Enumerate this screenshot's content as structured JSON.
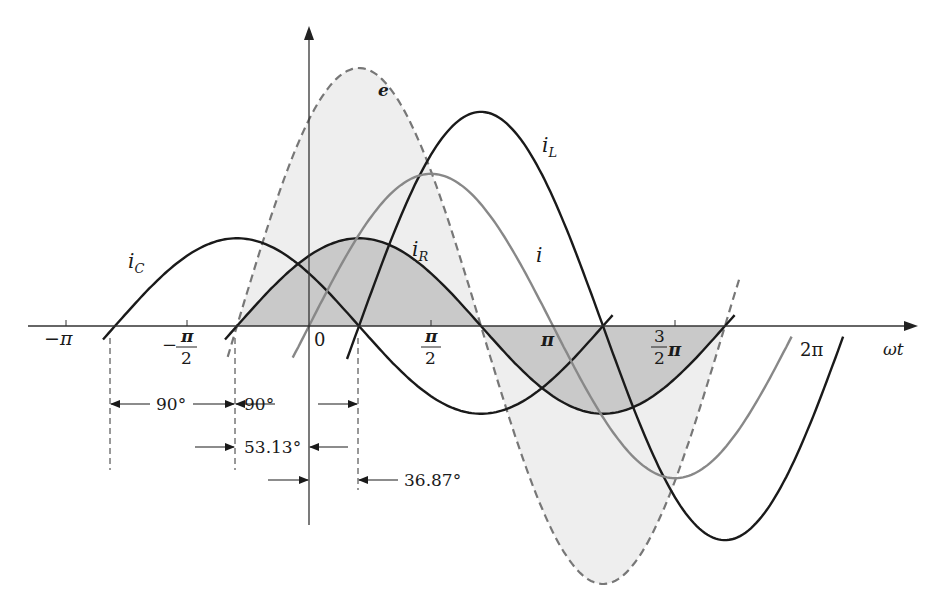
{
  "chart_data": {
    "type": "line",
    "title": "",
    "xlabel": "ωt",
    "ylabel": "",
    "x_ticks": [
      "−π",
      "−π/2",
      "0",
      "π/2",
      "π",
      "3/2 π",
      "2π"
    ],
    "x_units": "radians",
    "series": [
      {
        "name": "e",
        "style": "dashed",
        "color": "#777777",
        "amplitude": 1.0,
        "phase_deg": 53.13,
        "shaded": true
      },
      {
        "name": "i_R",
        "style": "solid",
        "color": "#1a1a1a",
        "amplitude": 0.34,
        "phase_deg": 53.13,
        "shaded": true
      },
      {
        "name": "i_C",
        "style": "solid",
        "color": "#1a1a1a",
        "amplitude": 0.34,
        "phase_deg": 143.13
      },
      {
        "name": "i_L",
        "style": "solid",
        "color": "#1a1a1a",
        "amplitude": 0.83,
        "phase_deg": -36.87
      },
      {
        "name": "i",
        "style": "solid",
        "color": "#888888",
        "amplitude": 0.59,
        "phase_deg": 0
      }
    ],
    "annotations": [
      "90°",
      "90°",
      "53.13°",
      "36.87°"
    ],
    "grid": false,
    "legend": "inline labels"
  },
  "labels": {
    "e": "e",
    "iC_base": "i",
    "iC_sub": "C",
    "iR_base": "i",
    "iR_sub": "R",
    "iL_base": "i",
    "iL_sub": "L",
    "i": "i",
    "wt": "ωt",
    "neg_pi": "−π",
    "neg_half_num": "π",
    "neg_half_den": "2",
    "neg_sign": "−",
    "zero": "0",
    "half_num": "π",
    "half_den": "2",
    "pi": "π",
    "threehalf_num": "3",
    "threehalf_den": "2",
    "threehalf_pi": "π",
    "two_pi": "2π",
    "dim_90a": "90°",
    "dim_90b": "90°",
    "dim_53": "53.13°",
    "dim_36": "36.87°"
  }
}
